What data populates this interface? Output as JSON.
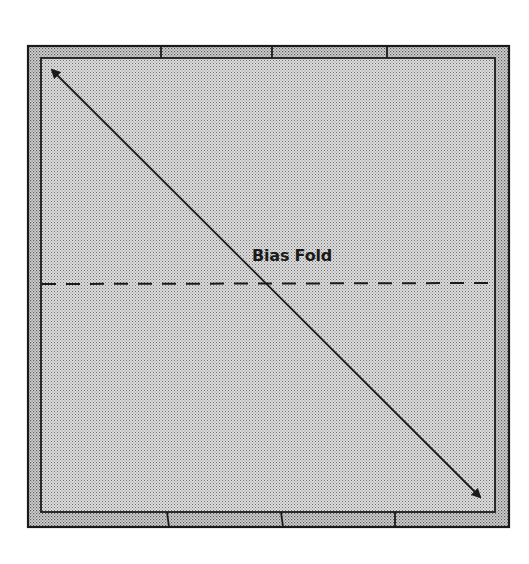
{
  "diagram": {
    "type": "quilt-block-fold-diagram",
    "label": "Bias Fold",
    "colors": {
      "fabric_fill": "#c9c9c9",
      "border_strip_fill": "#bdbdbd",
      "line": "#1a1a1a",
      "background": "#ffffff"
    },
    "outer_square": {
      "x": 28,
      "y": 46,
      "w": 481,
      "h": 481
    },
    "inner_square": {
      "x": 41,
      "y": 58,
      "w": 454,
      "h": 454
    },
    "top_strip_seams_x": [
      161,
      272,
      387
    ],
    "bottom_strip_seams_x": [
      168,
      282,
      395
    ],
    "fold_line": {
      "style": "dashed",
      "orientation": "horizontal",
      "y": 284,
      "x1": 42,
      "x2": 494
    },
    "bias_arrow": {
      "style": "double-headed",
      "x1": 49,
      "y1": 67,
      "x2": 483,
      "y2": 500
    }
  }
}
